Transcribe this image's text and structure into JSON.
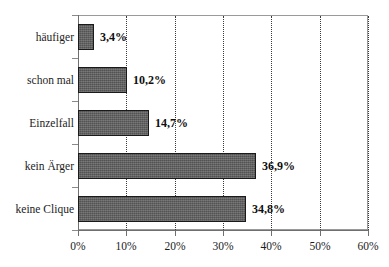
{
  "chart_data": {
    "type": "bar",
    "orientation": "horizontal",
    "title": "",
    "subtitle": "",
    "xlabel": "",
    "ylabel": "",
    "categories": [
      "häufiger",
      "schon mal",
      "Einzelfall",
      "kein Ärger",
      "keine Clique"
    ],
    "values": [
      3.4,
      10.2,
      14.7,
      36.9,
      34.8
    ],
    "value_labels": [
      "3,4%",
      "10,2%",
      "14,7%",
      "36,9%",
      "34,8%"
    ],
    "xlim": [
      0,
      60
    ],
    "xtick_values": [
      0,
      10,
      20,
      30,
      40,
      50,
      60
    ],
    "xtick_labels": [
      "0%",
      "10%",
      "20%",
      "30%",
      "40%",
      "50%",
      "60%"
    ],
    "grid": true,
    "grid_axis": "x",
    "grid_style": "dotted",
    "legend": false,
    "legend_position": "none",
    "colors": {
      "bar_fill": "#5e5e5e",
      "bar_border": "#1a1a1a",
      "gridline": "#3a3a3a",
      "axis": "#6f6f6f",
      "frame": "#9a9a9a",
      "text": "#1c1c1c",
      "value_text": "#0f0f0f",
      "background": "#ffffff"
    }
  }
}
